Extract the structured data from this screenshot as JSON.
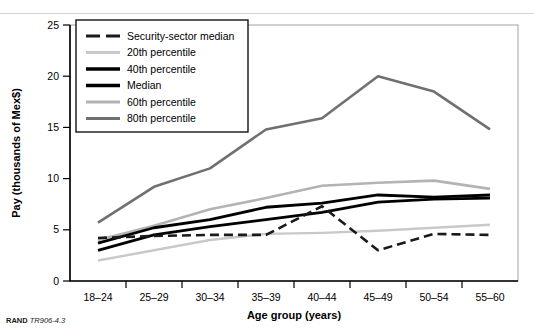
{
  "footer": {
    "brand": "RAND",
    "source_id": "TR906-4.3"
  },
  "chart_data": {
    "type": "line",
    "title": "",
    "xlabel": "Age group (years)",
    "ylabel": "Pay (thousands of Mex$)",
    "categories": [
      "18–24",
      "25–29",
      "30–34",
      "35–39",
      "40–44",
      "45–49",
      "50–54",
      "55–60"
    ],
    "xtick_labels": [
      "18–24",
      "25–29",
      "30–34",
      "35–39",
      "40–44",
      "45–49",
      "50–54",
      "55–60"
    ],
    "ylim": [
      0,
      25
    ],
    "ytick_values": [
      0,
      5,
      10,
      15,
      20,
      25
    ],
    "ytick_labels": [
      "0",
      "5",
      "10",
      "15",
      "20",
      "25"
    ],
    "grid": false,
    "legend_position": "top-left",
    "series": [
      {
        "name": "Security-sector median",
        "color": "#1a1a1a",
        "width": 2.6,
        "dash": "9,5",
        "values": [
          4.2,
          4.4,
          4.5,
          4.5,
          7.3,
          3.0,
          4.6,
          4.5
        ]
      },
      {
        "name": "20th percentile",
        "color": "#c9c9c9",
        "width": 2.4,
        "dash": "",
        "values": [
          2.0,
          3.0,
          4.0,
          4.6,
          4.7,
          4.9,
          5.2,
          5.5
        ]
      },
      {
        "name": "40th percentile",
        "color": "#000000",
        "width": 2.8,
        "dash": "",
        "values": [
          3.0,
          4.5,
          5.3,
          6.0,
          6.7,
          7.7,
          8.0,
          8.1
        ]
      },
      {
        "name": "Median",
        "color": "#000000",
        "width": 2.8,
        "dash": "",
        "values": [
          3.7,
          5.2,
          6.0,
          7.2,
          7.6,
          8.4,
          8.2,
          8.4
        ]
      },
      {
        "name": "60th percentile",
        "color": "#b3b3b3",
        "width": 2.6,
        "dash": "",
        "values": [
          4.0,
          5.4,
          7.0,
          8.1,
          9.3,
          9.6,
          9.8,
          9.0
        ]
      },
      {
        "name": "80th percentile",
        "color": "#707070",
        "width": 2.6,
        "dash": "",
        "values": [
          5.7,
          9.2,
          11.0,
          14.8,
          15.9,
          20.0,
          18.5,
          14.8
        ]
      }
    ]
  }
}
